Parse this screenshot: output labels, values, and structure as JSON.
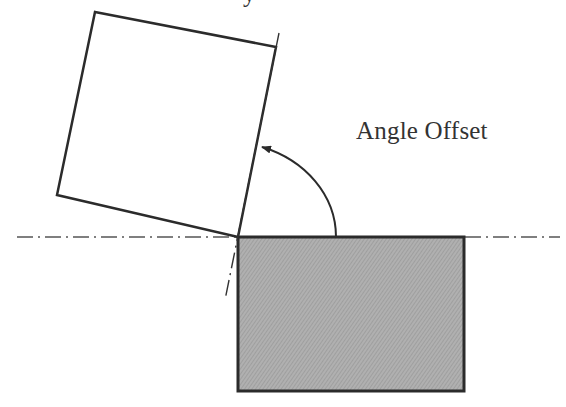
{
  "diagram": {
    "label": "Angle Offset",
    "cutoff_text": "y",
    "colors": {
      "stroke": "#2b2b2b",
      "fill_base": "#a9a9a9",
      "text": "#333333",
      "background": "#ffffff"
    },
    "shapes": {
      "rotated_square": [
        [
          95,
          12
        ],
        [
          276,
          47
        ],
        [
          238,
          237
        ],
        [
          57,
          195
        ]
      ],
      "base_rectangle": {
        "x": 238,
        "y": 237,
        "width": 226,
        "height": 154
      },
      "horizontal_axis": {
        "from": [
          17,
          237
        ],
        "to": [
          560,
          237
        ],
        "style": "dash-dot"
      },
      "tilted_axis": {
        "from": [
          279,
          33
        ],
        "to": [
          225,
          300
        ],
        "style": "dash-dot"
      },
      "angle_arc": {
        "start": [
          336,
          237
        ],
        "end": [
          260,
          146
        ],
        "arrow": "end"
      }
    }
  }
}
